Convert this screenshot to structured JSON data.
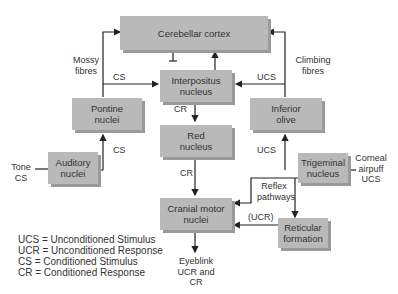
{
  "boxes": {
    "cerebellar_cortex": "Cerebellar cortex",
    "interpositus": "Interpositus nucleus",
    "pontine": "Pontine nuclei",
    "inferior_olive": "Inferior olive",
    "red_nucleus": "Red nucleus",
    "auditory": "Auditory nuclei",
    "trigeminal": "Trigeminal nucleus",
    "cranial_motor": "Cranial motor nuclei",
    "reticular": "Reticular formation"
  },
  "labels": {
    "mossy": "Mossy fibres",
    "climbing": "Climbing fibres",
    "cs_pontine_interpositus": "CS",
    "ucs_olive_interpositus": "UCS",
    "cr_interpositus_red": "CR",
    "cs_auditory_pontine": "CS",
    "ucs_trigeminal_olive": "UCS",
    "tone_cs": "Tone CS",
    "cr_red_cranial": "CR",
    "corneal": "Corneal airpuff UCS",
    "reflex": "Reflex pathways",
    "ucr": "(UCR)",
    "eyeblink": "Eyeblink UCR and CR"
  },
  "legend": [
    "UCS = Unconditioned Stimulus",
    "UCR = Unconditioned Response",
    "CS = Conditioned Stimulus",
    "CR = Conditioned Response"
  ]
}
